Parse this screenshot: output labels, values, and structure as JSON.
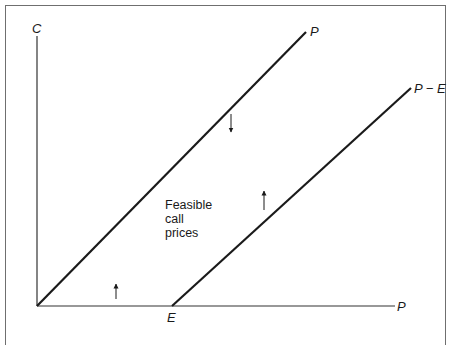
{
  "diagram": {
    "y_axis_label": "C",
    "x_axis_label": "P",
    "x_axis_marker_label": "E",
    "upper_bound_line_label": "P",
    "lower_bound_line_label": "P − E",
    "region_label_lines": [
      "Feasible",
      "call",
      "prices"
    ],
    "arrows": [
      {
        "name": "up-arrow-near-origin",
        "direction": "up"
      },
      {
        "name": "down-arrow-below-upper-bound",
        "direction": "down"
      },
      {
        "name": "up-arrow-above-lower-bound",
        "direction": "up"
      }
    ],
    "colors": {
      "line": "#1a1a1a",
      "axis": "#333333",
      "frame": "#6f6f6f",
      "background": "#ffffff"
    }
  }
}
